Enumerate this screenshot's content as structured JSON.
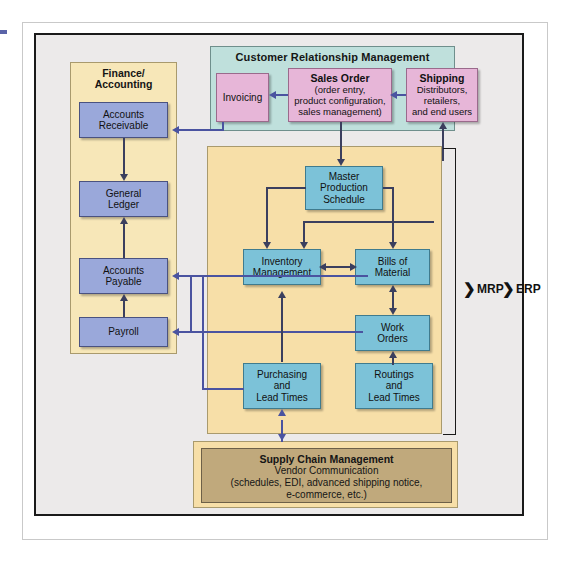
{
  "diagram": {
    "colors": {
      "blue_node": "#9aa8da",
      "pink_node": "#e7b6d8",
      "teal_node": "#7cc2d8",
      "crm_region": "#bfe0dc",
      "finance_region": "#f7e7b8",
      "mrp_region": "#f7dfa8",
      "scm_inner": "#c0a97c",
      "connector": "#4a53a0",
      "frame": "#1a1a1a"
    }
  },
  "regions": {
    "crm": {
      "title": "Customer Relationship Management"
    },
    "finance": {
      "title_line1": "Finance/",
      "title_line2": "Accounting"
    },
    "mrp": {
      "title": ""
    },
    "scm": {
      "title": "Supply Chain Management",
      "line2": "Vendor Communication",
      "line3": "(schedules, EDI, advanced shipping notice,",
      "line4": "e-commerce, etc.)"
    }
  },
  "nodes": {
    "accounts_receivable": {
      "line1": "Accounts",
      "line2": "Receivable"
    },
    "general_ledger": {
      "line1": "General",
      "line2": "Ledger"
    },
    "accounts_payable": {
      "line1": "Accounts",
      "line2": "Payable"
    },
    "payroll": {
      "line1": "Payroll"
    },
    "invoicing": {
      "line1": "Invoicing"
    },
    "sales_order": {
      "title": "Sales Order",
      "line1": "(order entry,",
      "line2": "product configuration,",
      "line3": "sales management)"
    },
    "shipping": {
      "title": "Shipping",
      "line1": "Distributors,",
      "line2": "retailers,",
      "line3": "and end users"
    },
    "master_production_schedule": {
      "line1": "Master",
      "line2": "Production",
      "line3": "Schedule"
    },
    "inventory_management": {
      "line1": "Inventory",
      "line2": "Management"
    },
    "bills_of_material": {
      "line1": "Bills of",
      "line2": "Material"
    },
    "work_orders": {
      "line1": "Work",
      "line2": "Orders"
    },
    "purchasing_lead_times": {
      "line1": "Purchasing",
      "line2": "and",
      "line3": "Lead Times"
    },
    "routings_lead_times": {
      "line1": "Routings",
      "line2": "and",
      "line3": "Lead Times"
    }
  },
  "brackets": {
    "mrp": {
      "label": "MRP",
      "chevron": "❯"
    },
    "erp": {
      "label": "ERP",
      "chevron": "❯"
    }
  }
}
